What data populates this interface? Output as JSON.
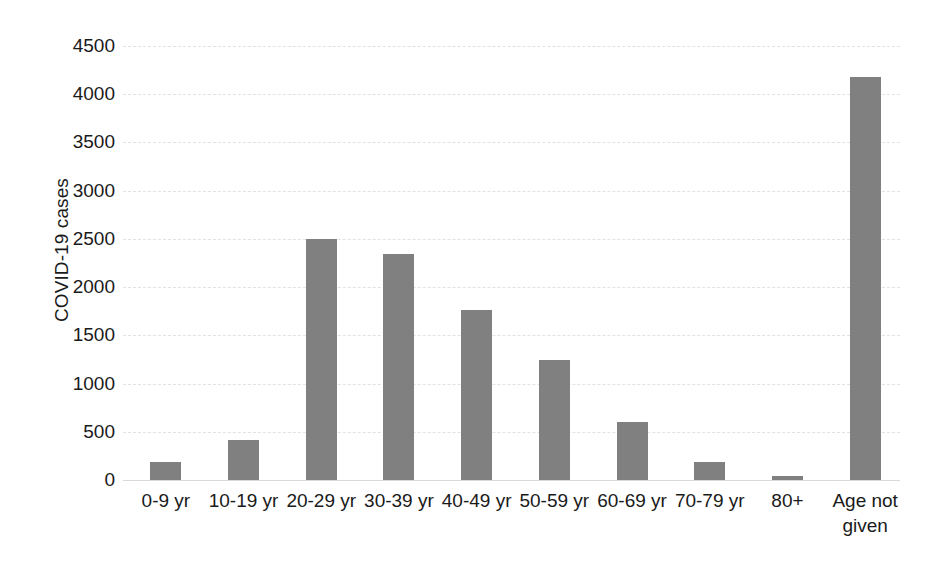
{
  "chart_data": {
    "type": "bar",
    "title": "",
    "xlabel": "",
    "ylabel": "COVID-19 cases",
    "categories": [
      "0-9 yr",
      "10-19 yr",
      "20-29 yr",
      "30-39 yr",
      "40-49 yr",
      "50-59 yr",
      "60-69 yr",
      "70-79 yr",
      "80+",
      "Age not\ngiven"
    ],
    "values": [
      190,
      420,
      2500,
      2340,
      1760,
      1240,
      600,
      190,
      40,
      4175
    ],
    "ylim": [
      0,
      4500
    ],
    "yticks": [
      0,
      500,
      1000,
      1500,
      2000,
      2500,
      3000,
      3500,
      4000,
      4500
    ],
    "ytick_labels": [
      "0",
      "500",
      "1000",
      "1500",
      "2000",
      "2500",
      "3000",
      "3500",
      "4000",
      "4500"
    ],
    "grid": true,
    "legend": false,
    "series": [
      {
        "name": "COVID-19 cases",
        "color": "#808080",
        "values": [
          190,
          420,
          2500,
          2340,
          1760,
          1240,
          600,
          190,
          40,
          4175
        ]
      }
    ]
  },
  "colors": {
    "bar": "#808080",
    "gridline": "#e2e2e2",
    "axis": "#d9d9d9",
    "text": "#1a1a1a",
    "background": "#ffffff"
  }
}
